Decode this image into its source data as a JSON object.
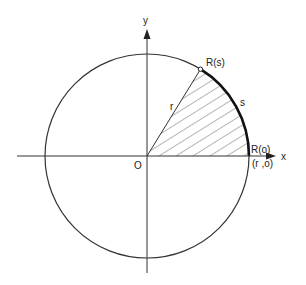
{
  "diagram": {
    "axes": {
      "x_label": "x",
      "y_label": "y",
      "origin_label": "O"
    },
    "points": {
      "arc_end": "R(s)",
      "arc_start": "R(o)",
      "arc_start_coords": "(r ,o)"
    },
    "labels": {
      "radius": "r",
      "arc_length": "s"
    },
    "colors": {
      "stroke": "#222222",
      "background": "#ffffff"
    }
  }
}
